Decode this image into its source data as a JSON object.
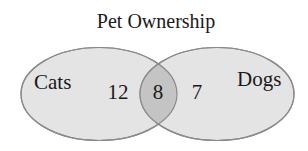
{
  "diagram": {
    "type": "venn",
    "title": "Pet Ownership",
    "sets": [
      {
        "label": "Cats",
        "only_count": "12"
      },
      {
        "label": "Dogs",
        "only_count": "7"
      }
    ],
    "intersection_count": "8",
    "colors": {
      "fill": "#e4e4e4",
      "overlap_fill": "#c4c4c4",
      "stroke": "#8a8a8a",
      "text": "#1a1a1a"
    }
  }
}
